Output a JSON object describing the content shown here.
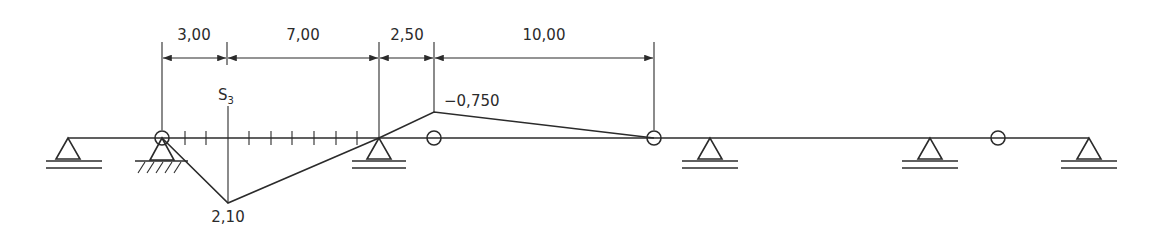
{
  "diagram": {
    "type": "influence-line",
    "dimensions": [
      {
        "label": "3,00",
        "from_x": 162,
        "to_x": 227
      },
      {
        "label": "7,00",
        "from_x": 227,
        "to_x": 379
      },
      {
        "label": "2,50",
        "from_x": 379,
        "to_x": 434
      },
      {
        "label": "10,00",
        "from_x": 434,
        "to_x": 654
      }
    ],
    "section_label": "S",
    "section_subscript": "3",
    "ordinates": {
      "max_positive": "2,10",
      "max_negative": "−0,750"
    },
    "supports": [
      {
        "type": "roller",
        "x": 68
      },
      {
        "type": "pinned-fixed",
        "x": 162
      },
      {
        "type": "roller",
        "x": 379
      },
      {
        "type": "roller",
        "x": 710
      },
      {
        "type": "roller",
        "x": 930
      },
      {
        "type": "roller",
        "x": 1089
      }
    ],
    "hinges": [
      162,
      434,
      654,
      998
    ],
    "colors": {
      "line": "#2b2b2b",
      "background": "#ffffff"
    }
  }
}
